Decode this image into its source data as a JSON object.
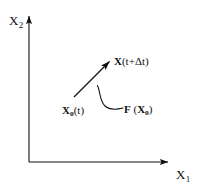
{
  "figure": {
    "name": "phase-space-trajectory-diagram",
    "background_color": "#ffffff",
    "line_color": "#111111",
    "width": 197,
    "height": 191
  },
  "axes": {
    "y_label_base": "X",
    "y_label_sub": "2",
    "x_label_base": "X",
    "x_label_sub": "1",
    "origin": {
      "x": 29,
      "y": 162
    },
    "y_tip": {
      "x": 29,
      "y": 12
    },
    "x_tip": {
      "x": 172,
      "y": 162
    },
    "arrowheads": "filled-triangle"
  },
  "vector": {
    "name": "displacement-arrow",
    "start": {
      "x": 74,
      "y": 97
    },
    "end": {
      "x": 112,
      "y": 59
    },
    "arrowhead": "filled-triangle"
  },
  "leader": {
    "name": "curved-leader-line",
    "start": {
      "x": 98,
      "y": 86
    },
    "end": {
      "x": 124,
      "y": 108
    }
  },
  "labels": {
    "x_future": {
      "bold_symbol": "X",
      "rest": "(t+Δt)"
    },
    "x_initial": {
      "bold_symbol": "X",
      "sub": "o",
      "rest": "(t)"
    },
    "force": {
      "bold_symbol": "F",
      "open": " (",
      "bold_arg": "X",
      "arg_sub": "o",
      "close": ")"
    }
  }
}
